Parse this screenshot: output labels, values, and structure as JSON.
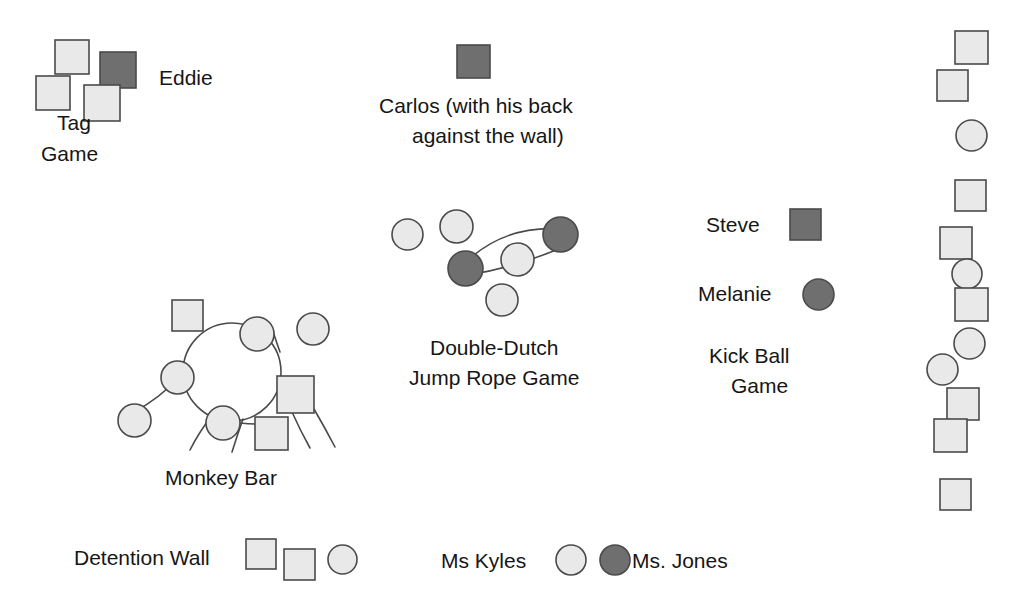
{
  "diagram": {
    "canvas": {
      "width": 1020,
      "height": 613,
      "background": "#ffffff"
    },
    "legend_colors": {
      "light_shape_fill": "#e9e9e9",
      "dark_shape_fill": "#6f6f6f",
      "shape_stroke": "#4a4a4a",
      "line_stroke": "#4a4a4a",
      "text": "#161616"
    },
    "shape_meaning": {
      "square": "boy",
      "circle": "girl",
      "light_fill": "student",
      "dark_fill": "focal student"
    },
    "labels": {
      "tag_game": "Tag\nGame",
      "tag_game_line1": "Tag",
      "tag_game_line2": "Game",
      "eddie": "Eddie",
      "carlos_line1": "Carlos (with his back",
      "carlos_line2": "against the wall)",
      "double_dutch_line1": "Double-Dutch",
      "double_dutch_line2": "Jump Rope Game",
      "monkey_bar": "Monkey Bar",
      "steve": "Steve",
      "melanie": "Melanie",
      "kick_ball_line1": "Kick Ball",
      "kick_ball_line2": "Game",
      "detention_wall": "Detention Wall",
      "ms_kyles": "Ms Kyles",
      "ms_jones": "Ms. Jones"
    },
    "groups": {
      "tag_game": {
        "name": "Tag Game",
        "shapes": [
          {
            "kind": "square",
            "tone": "light",
            "x": 55,
            "y": 40,
            "size": 34
          },
          {
            "kind": "square",
            "tone": "dark",
            "x": 100,
            "y": 52,
            "size": 36
          },
          {
            "kind": "square",
            "tone": "light",
            "x": 36,
            "y": 76,
            "size": 34
          },
          {
            "kind": "square",
            "tone": "light",
            "x": 84,
            "y": 85,
            "size": 36
          }
        ]
      },
      "carlos": {
        "name": "Carlos",
        "shapes": [
          {
            "kind": "square",
            "tone": "dark",
            "x": 457,
            "y": 45,
            "size": 33
          }
        ]
      },
      "double_dutch": {
        "name": "Double-Dutch Jump Rope Game",
        "shapes": [
          {
            "kind": "circle",
            "tone": "light",
            "x": 392,
            "y": 219,
            "size": 31
          },
          {
            "kind": "circle",
            "tone": "light",
            "x": 440,
            "y": 210,
            "size": 33
          },
          {
            "kind": "circle",
            "tone": "dark",
            "x": 543,
            "y": 217,
            "size": 35
          },
          {
            "kind": "circle",
            "tone": "dark",
            "x": 448,
            "y": 251,
            "size": 35
          },
          {
            "kind": "circle",
            "tone": "light",
            "x": 501,
            "y": 243,
            "size": 33
          },
          {
            "kind": "circle",
            "tone": "light",
            "x": 486,
            "y": 284,
            "size": 32
          }
        ],
        "ropes": [
          {
            "from": [
              466,
              262
            ],
            "ctrl": [
              505,
              225
            ],
            "to": [
              561,
              229
            ]
          },
          {
            "from": [
              468,
              275
            ],
            "ctrl": [
              515,
              268
            ],
            "to": [
              568,
              245
            ]
          }
        ]
      },
      "monkey_bar": {
        "name": "Monkey Bar",
        "ring": {
          "cx": 232,
          "cy": 372,
          "r": 49
        },
        "shapes": [
          {
            "kind": "square",
            "tone": "light",
            "x": 172,
            "y": 300,
            "size": 31
          },
          {
            "kind": "circle",
            "tone": "light",
            "x": 240,
            "y": 317,
            "size": 34
          },
          {
            "kind": "circle",
            "tone": "light",
            "x": 297,
            "y": 313,
            "size": 32
          },
          {
            "kind": "circle",
            "tone": "light",
            "x": 161,
            "y": 361,
            "size": 33
          },
          {
            "kind": "circle",
            "tone": "light",
            "x": 118,
            "y": 404,
            "size": 33
          },
          {
            "kind": "circle",
            "tone": "light",
            "x": 206,
            "y": 406,
            "size": 34
          },
          {
            "kind": "square",
            "tone": "light",
            "x": 277,
            "y": 376,
            "size": 37
          },
          {
            "kind": "square",
            "tone": "light",
            "x": 255,
            "y": 417,
            "size": 33
          }
        ],
        "tendrils": [
          {
            "from": [
              178,
              378
            ],
            "ctrl": [
              160,
              398
            ],
            "to": [
              134,
              412
            ]
          },
          {
            "from": [
              213,
              414
            ],
            "ctrl": [
              199,
              432
            ],
            "to": [
              190,
              450
            ]
          },
          {
            "from": [
              243,
              419
            ],
            "ctrl": [
              237,
              436
            ],
            "to": [
              232,
              452
            ]
          },
          {
            "from": [
              240,
              423
            ],
            "ctrl": [
              248,
              424
            ],
            "to": [
              256,
              424
            ]
          },
          {
            "from": [
              292,
              412
            ],
            "ctrl": [
              300,
              430
            ],
            "to": [
              310,
              448
            ]
          },
          {
            "from": [
              314,
              409
            ],
            "ctrl": [
              325,
              428
            ],
            "to": [
              335,
              447
            ]
          },
          {
            "from": [
              280,
              352
            ],
            "ctrl": [
              275,
              338
            ],
            "to": [
              272,
              328
            ]
          }
        ]
      },
      "kick_ball": {
        "name": "Kick Ball Game",
        "shapes": [
          {
            "kind": "square",
            "tone": "dark",
            "x": 790,
            "y": 209,
            "size": 31
          },
          {
            "kind": "circle",
            "tone": "dark",
            "x": 803,
            "y": 279,
            "size": 31
          },
          {
            "kind": "square",
            "tone": "light",
            "x": 955,
            "y": 31,
            "size": 33
          },
          {
            "kind": "square",
            "tone": "light",
            "x": 937,
            "y": 70,
            "size": 31
          },
          {
            "kind": "circle",
            "tone": "light",
            "x": 956,
            "y": 120,
            "size": 31
          },
          {
            "kind": "square",
            "tone": "light",
            "x": 955,
            "y": 180,
            "size": 31
          },
          {
            "kind": "square",
            "tone": "light",
            "x": 940,
            "y": 227,
            "size": 32
          },
          {
            "kind": "circle",
            "tone": "light",
            "x": 952,
            "y": 259,
            "size": 30
          },
          {
            "kind": "square",
            "tone": "light",
            "x": 955,
            "y": 288,
            "size": 33
          },
          {
            "kind": "circle",
            "tone": "light",
            "x": 954,
            "y": 328,
            "size": 31
          },
          {
            "kind": "circle",
            "tone": "light",
            "x": 927,
            "y": 354,
            "size": 31
          },
          {
            "kind": "square",
            "tone": "light",
            "x": 947,
            "y": 388,
            "size": 32
          },
          {
            "kind": "square",
            "tone": "light",
            "x": 934,
            "y": 419,
            "size": 33
          },
          {
            "kind": "square",
            "tone": "light",
            "x": 940,
            "y": 479,
            "size": 31
          }
        ]
      },
      "detention_wall": {
        "name": "Detention Wall",
        "shapes": [
          {
            "kind": "square",
            "tone": "light",
            "x": 246,
            "y": 539,
            "size": 30
          },
          {
            "kind": "square",
            "tone": "light",
            "x": 284,
            "y": 549,
            "size": 31
          },
          {
            "kind": "circle",
            "tone": "light",
            "x": 328,
            "y": 545,
            "size": 29
          }
        ]
      },
      "teacher_key": {
        "name": "Teacher Key",
        "shapes": [
          {
            "kind": "circle",
            "tone": "light",
            "x": 556,
            "y": 545,
            "size": 30
          },
          {
            "kind": "circle",
            "tone": "dark",
            "x": 600,
            "y": 545,
            "size": 30
          }
        ]
      }
    }
  }
}
